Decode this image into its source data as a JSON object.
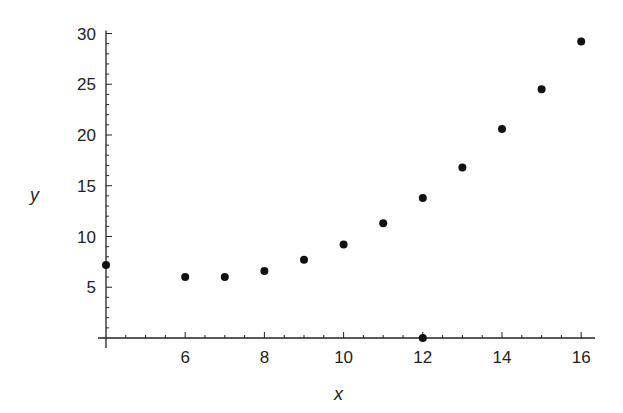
{
  "chart_data": {
    "type": "scatter",
    "title": "",
    "xlabel": "x",
    "ylabel": "y",
    "xlim": [
      4,
      16.35
    ],
    "ylim": [
      0,
      30.3
    ],
    "grid": false,
    "legend": null,
    "x_ticks": [
      6,
      8,
      10,
      12,
      14,
      16
    ],
    "x_minor_step": 0.5,
    "y_ticks": [
      5,
      10,
      15,
      20,
      25,
      30
    ],
    "y_minor_step": 1,
    "series": [
      {
        "name": "data",
        "points": [
          {
            "x": 4,
            "y": 7.2
          },
          {
            "x": 6,
            "y": 6.0
          },
          {
            "x": 7,
            "y": 6.0
          },
          {
            "x": 8,
            "y": 6.6
          },
          {
            "x": 9,
            "y": 7.7
          },
          {
            "x": 10,
            "y": 9.2
          },
          {
            "x": 11,
            "y": 11.3
          },
          {
            "x": 12,
            "y": 13.8
          },
          {
            "x": 12,
            "y": 0
          },
          {
            "x": 13,
            "y": 16.8
          },
          {
            "x": 14,
            "y": 20.6
          },
          {
            "x": 15,
            "y": 24.5
          },
          {
            "x": 16,
            "y": 29.2
          }
        ]
      }
    ]
  },
  "labels": {
    "x_axis": "x",
    "y_axis": "y"
  }
}
